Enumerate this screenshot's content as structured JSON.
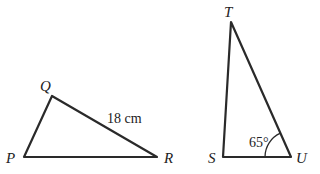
{
  "triangles": [
    {
      "name": "PQR",
      "vertices": [
        {
          "label": "P",
          "x": 24,
          "y": 157
        },
        {
          "label": "Q",
          "x": 52,
          "y": 96
        },
        {
          "label": "R",
          "x": 157,
          "y": 157
        }
      ],
      "side_labels": [
        {
          "side": "QR",
          "text": "18 cm"
        }
      ]
    },
    {
      "name": "STU",
      "vertices": [
        {
          "label": "S",
          "x": 223,
          "y": 157
        },
        {
          "label": "T",
          "x": 231,
          "y": 22
        },
        {
          "label": "U",
          "x": 291,
          "y": 157
        }
      ],
      "angle_labels": [
        {
          "vertex": "U",
          "text": "65°"
        }
      ]
    }
  ],
  "labels": {
    "P": "P",
    "Q": "Q",
    "R": "R",
    "S": "S",
    "T": "T",
    "U": "U",
    "side_QR": "18 cm",
    "angle_U": "65°"
  }
}
